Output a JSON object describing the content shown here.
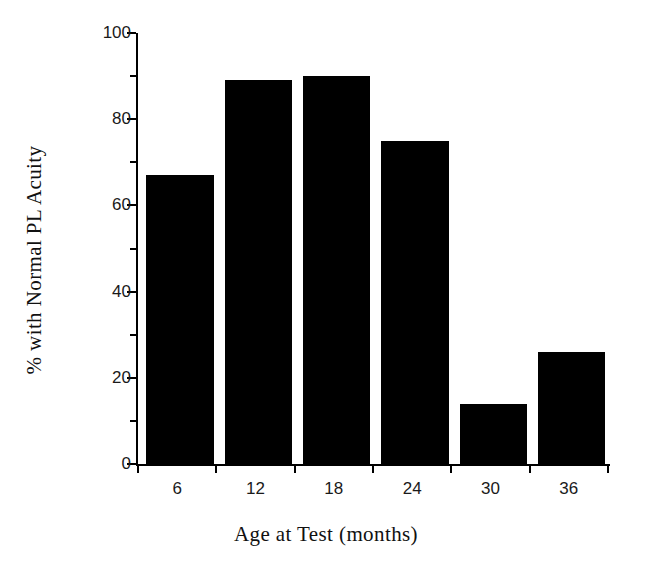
{
  "chart_data": {
    "type": "bar",
    "title": "",
    "subtitle": "",
    "xlabel": "Age at Test (months)",
    "ylabel": "% with Normal PL Acuity",
    "categories": [
      "6",
      "12",
      "18",
      "24",
      "30",
      "36"
    ],
    "values": [
      67,
      89,
      90,
      75,
      14,
      26
    ],
    "series": [
      {
        "name": "% with Normal PL Acuity",
        "values": [
          67,
          89,
          90,
          75,
          14,
          26
        ]
      }
    ],
    "ylim": [
      0,
      100
    ],
    "yticks": [
      0,
      20,
      40,
      60,
      80,
      100
    ],
    "ytick_labels": [
      "0",
      "20",
      "40",
      "60",
      "80",
      "100"
    ],
    "yminor_ticks": [
      10,
      30,
      50,
      70,
      90
    ],
    "xtick_labels": [
      "6",
      "12",
      "18",
      "24",
      "30",
      "36"
    ],
    "grid": false,
    "legend": false,
    "legend_position": "none",
    "bar_color": "#000000",
    "background_color": "#ffffff",
    "axis_color": "#000000",
    "annotations": []
  },
  "axes": {
    "y_title": "% with Normal PL Acuity",
    "x_title": "Age at Test (months)"
  }
}
